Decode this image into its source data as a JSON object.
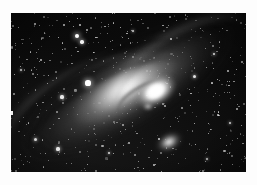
{
  "page": {
    "background_color": "#fdfdfd",
    "width": 257,
    "height": 185
  },
  "photograph": {
    "name": "andromeda-galaxy-plate",
    "subject": "Andromeda Galaxy (M31)",
    "alt_text": "Black and white astronomical photograph of the Andromeda Galaxy, a large tilted spiral galaxy with a brilliant white nucleus, dark dust lanes crossing the lower disk, two small companion galaxies and a dense field of foreground stars.",
    "media": "monochrome photographic plate",
    "frame": {
      "left": 11,
      "top": 13,
      "width": 235,
      "height": 159,
      "border_color": "#000000"
    },
    "palette": {
      "sky": "#070707",
      "disk_glow": "#9a9a9a",
      "nucleus": "#ffffff",
      "dust_lane": "#000000",
      "page": "#fdfdfd"
    },
    "features": [
      {
        "id": "nucleus",
        "label": "Galactic nucleus",
        "x": 144,
        "y": 78,
        "brightness": "saturated white"
      },
      {
        "id": "disk",
        "label": "Inclined spiral disk",
        "position_angle_deg": -31,
        "major_axis_px": 250,
        "minor_axis_px": 92
      },
      {
        "id": "dust-lanes",
        "label": "Dark dust lanes",
        "count": 4,
        "side": "south-west flank"
      },
      {
        "id": "satellite-m110",
        "label": "Companion galaxy M110",
        "x": 158,
        "y": 129
      },
      {
        "id": "satellite-m32",
        "label": "Companion galaxy M32",
        "x": 137,
        "y": 93
      },
      {
        "id": "bright-star-a",
        "label": "Bright foreground star",
        "x": 77,
        "y": 70
      },
      {
        "id": "bright-star-b",
        "label": "Bright foreground star pair",
        "x": 66,
        "y": 24
      }
    ]
  },
  "stars": {
    "note": "x, y are plate-local pixel coords; r is radius in px; o is opacity",
    "bright": [
      {
        "x": 66,
        "y": 23,
        "r": 2.4,
        "o": 1.0
      },
      {
        "x": 71,
        "y": 29,
        "r": 1.7,
        "o": 0.95
      },
      {
        "x": 77,
        "y": 70,
        "r": 2.6,
        "o": 1.0
      },
      {
        "x": 51,
        "y": 84,
        "r": 1.6,
        "o": 0.9
      },
      {
        "x": 183,
        "y": 63,
        "r": 1.5,
        "o": 0.88
      },
      {
        "x": 203,
        "y": 41,
        "r": 1.4,
        "o": 0.85
      },
      {
        "x": 24,
        "y": 126,
        "r": 1.5,
        "o": 0.9
      },
      {
        "x": 47,
        "y": 136,
        "r": 1.6,
        "o": 0.92
      },
      {
        "x": 98,
        "y": 140,
        "r": 1.4,
        "o": 0.85
      },
      {
        "x": 219,
        "y": 110,
        "r": 1.4,
        "o": 0.85
      },
      {
        "x": 122,
        "y": 18,
        "r": 1.3,
        "o": 0.8
      },
      {
        "x": 160,
        "y": 26,
        "r": 1.2,
        "o": 0.78
      },
      {
        "x": 10,
        "y": 57,
        "r": 1.3,
        "o": 0.8
      },
      {
        "x": 196,
        "y": 146,
        "r": 1.3,
        "o": 0.82
      },
      {
        "x": 143,
        "y": 152,
        "r": 1.2,
        "o": 0.78
      }
    ],
    "field_count": 520,
    "seed": 1337
  }
}
